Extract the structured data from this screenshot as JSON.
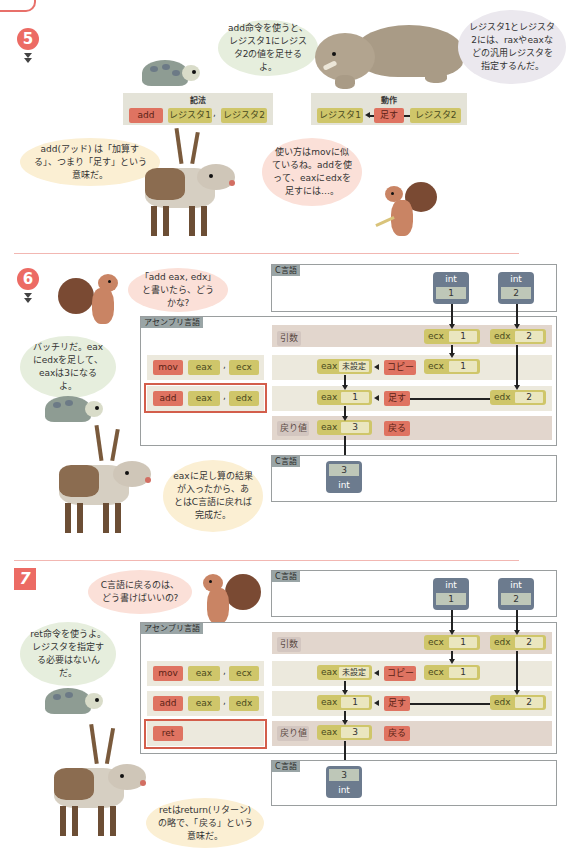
{
  "step5": {
    "number": "5",
    "bubble_turtle": "add命令を使うと、レジスタ1にレジスタ2の値を足せるよ。",
    "notation_title": "記法",
    "notation": {
      "op": "add",
      "arg1": "レジスタ1",
      "sep": ",",
      "arg2": "レジスタ2"
    },
    "action_title": "動作",
    "action": {
      "dst": "レジスタ1",
      "op": "足す",
      "src": "レジスタ2"
    },
    "bubble_elephant": "レジスタ1とレジスタ2には、raxやeaxなどの汎用レジスタを指定するんだ。",
    "bubble_reindeer": "add(アッド) は「加算する」、つまり「足す」という意味だ。",
    "bubble_squirrel": "使い方はmovに似ているね。addを使って、eaxにedxを足すには…。"
  },
  "step6": {
    "number": "6",
    "bubble_squirrel": "「add eax, edx」と書いたら、どうかな?",
    "bubble_turtle": "バッチリだ。eaxにedxを足して、eaxは3になるよ。",
    "bubble_reindeer": "eaxに足し算の結果が入ったから、あとはC言語に戻れば完成だ。",
    "c_label_top": "C言語",
    "asm_label": "アセンブリ言語",
    "c_label_bottom": "C言語",
    "int1": {
      "type": "int",
      "value": "1"
    },
    "int2": {
      "type": "int",
      "value": "2"
    },
    "row_args": {
      "label": "引数",
      "reg1": "ecx",
      "val1": "1",
      "reg2": "edx",
      "val2": "2"
    },
    "row_mov": {
      "op": "mov",
      "a1": "eax",
      "sep": ",",
      "a2": "ecx",
      "dst_reg": "eax",
      "dst_val": "未設定",
      "action": "コピー",
      "src_reg": "ecx",
      "src_val": "1"
    },
    "row_add": {
      "op": "add",
      "a1": "eax",
      "sep": ",",
      "a2": "edx",
      "dst_reg": "eax",
      "dst_val": "1",
      "action": "足す",
      "src_reg": "edx",
      "src_val": "2"
    },
    "row_ret": {
      "label": "戻り値",
      "reg": "eax",
      "val": "3",
      "action": "戻る"
    },
    "result": {
      "value": "3",
      "type": "int"
    }
  },
  "step7": {
    "number": "7",
    "bubble_squirrel": "C言語に戻るのは、どう書けばいいの?",
    "bubble_turtle": "ret命令を使うよ。レジスタを指定する必要はないんだ。",
    "bubble_reindeer": "retはreturn(リターン)の略で、「戻る」という意味だ。",
    "c_label_top": "C言語",
    "asm_label": "アセンブリ言語",
    "c_label_bottom": "C言語",
    "int1": {
      "type": "int",
      "value": "1"
    },
    "int2": {
      "type": "int",
      "value": "2"
    },
    "row_args": {
      "label": "引数",
      "reg1": "ecx",
      "val1": "1",
      "reg2": "edx",
      "val2": "2"
    },
    "row_mov": {
      "op": "mov",
      "a1": "eax",
      "sep": ",",
      "a2": "ecx",
      "dst_reg": "eax",
      "dst_val": "未設定",
      "action": "コピー",
      "src_reg": "ecx",
      "src_val": "1"
    },
    "row_add": {
      "op": "add",
      "a1": "eax",
      "sep": ",",
      "a2": "edx",
      "dst_reg": "eax",
      "dst_val": "1",
      "action": "足す",
      "src_reg": "edx",
      "src_val": "2"
    },
    "row_ret": {
      "op": "ret",
      "label": "戻り値",
      "reg": "eax",
      "val": "3",
      "action": "戻る"
    },
    "result": {
      "value": "3",
      "type": "int"
    }
  },
  "colors": {
    "accent_red": "#ec6b64",
    "chip_red": "#df7361",
    "chip_olive": "#cfc66a",
    "int_box": "#6c7b8e",
    "frame_grey": "#9a9e9f"
  }
}
